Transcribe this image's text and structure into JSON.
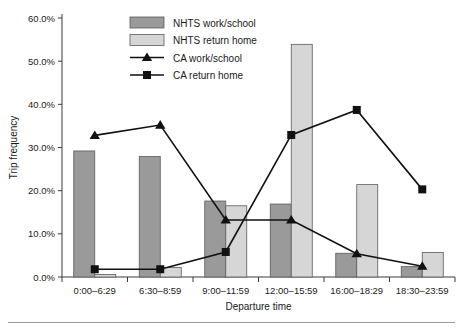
{
  "chart_data": {
    "type": "bar",
    "title": "",
    "xlabel": "Departure time",
    "ylabel": "Trip frequency",
    "ylim": [
      0,
      60
    ],
    "ytick_labels": [
      "0.0%",
      "10.0%",
      "20.0%",
      "30.0%",
      "40.0%",
      "50.0%",
      "60.0%"
    ],
    "ytick_values": [
      0,
      10,
      20,
      30,
      40,
      50,
      60
    ],
    "grid": false,
    "legend_position": "top-center",
    "categories": [
      "0:00–6:29",
      "6:30–8:59",
      "9:00–11:59",
      "12:00–15:59",
      "16:00–18:29",
      "18:30–23:59"
    ],
    "series": [
      {
        "name": "NHTS work/school",
        "type": "bar",
        "color": "#9a9a9a",
        "values": [
          29.2,
          27.9,
          17.6,
          16.9,
          5.5,
          2.4
        ]
      },
      {
        "name": "NHTS return home",
        "type": "bar",
        "color": "#d6d6d6",
        "values": [
          0.6,
          2.2,
          16.5,
          53.9,
          21.4,
          5.7
        ]
      },
      {
        "name": "CA work/school",
        "type": "line",
        "marker": "triangle",
        "color": "#111111",
        "values": [
          32.8,
          35.2,
          13.2,
          13.2,
          5.4,
          2.5
        ]
      },
      {
        "name": "CA return home",
        "type": "line",
        "marker": "square",
        "color": "#111111",
        "values": [
          1.8,
          1.8,
          5.8,
          32.9,
          38.7,
          20.3
        ]
      }
    ]
  }
}
